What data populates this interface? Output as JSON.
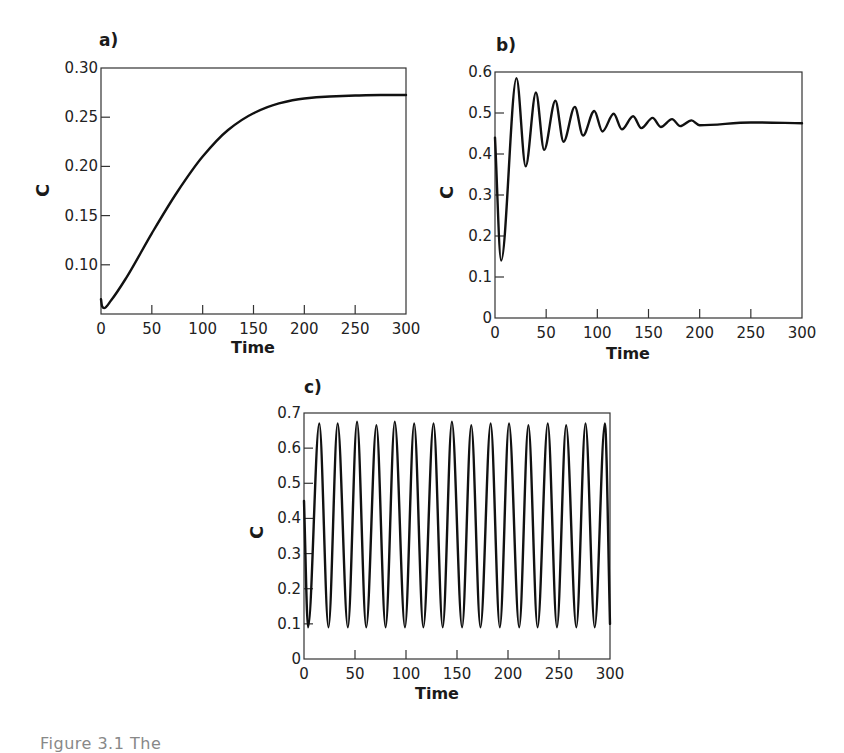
{
  "figure": {
    "caption_partial": "Figure 3.1  The"
  },
  "chart_data": [
    {
      "id": "a",
      "type": "line",
      "panel_label": "a)",
      "title": "",
      "xlabel": "Time",
      "ylabel": "C",
      "xlim": [
        0,
        300
      ],
      "ylim": [
        0.05,
        0.3
      ],
      "xticks": [
        0,
        50,
        100,
        150,
        200,
        250,
        300
      ],
      "xtick_labels": [
        "0",
        "50",
        "100",
        "150",
        "200",
        "250",
        "300"
      ],
      "yticks": [
        0.1,
        0.15,
        0.2,
        0.25,
        0.3
      ],
      "ytick_labels": [
        "0.10",
        "0.15",
        "0.20",
        "0.25",
        "0.30"
      ],
      "grid": false,
      "legend": null,
      "series": [
        {
          "name": "C",
          "color": "#111111",
          "x": [
            0,
            1,
            3,
            10,
            25,
            50,
            75,
            100,
            125,
            150,
            175,
            200,
            225,
            250,
            275,
            300
          ],
          "y": [
            0.065,
            0.058,
            0.056,
            0.064,
            0.087,
            0.132,
            0.174,
            0.21,
            0.237,
            0.254,
            0.264,
            0.269,
            0.271,
            0.272,
            0.2725,
            0.2725
          ]
        }
      ],
      "box": {
        "left": 101,
        "top": 68,
        "width": 305,
        "height": 246
      }
    },
    {
      "id": "b",
      "type": "line",
      "panel_label": "b)",
      "title": "",
      "xlabel": "Time",
      "ylabel": "C",
      "xlim": [
        0,
        300
      ],
      "ylim": [
        0,
        0.6
      ],
      "xticks": [
        0,
        50,
        100,
        150,
        200,
        250,
        300
      ],
      "xtick_labels": [
        "0",
        "50",
        "100",
        "150",
        "200",
        "250",
        "300"
      ],
      "yticks": [
        0,
        0.1,
        0.2,
        0.3,
        0.4,
        0.5,
        0.6
      ],
      "ytick_labels": [
        "0",
        "0.1",
        "0.2",
        "0.3",
        "0.4",
        "0.5",
        "0.6"
      ],
      "grid": false,
      "legend": null,
      "description": "Damped oscillation settling to steady state",
      "steady_state": 0.475,
      "period": 19,
      "series": [
        {
          "name": "C",
          "color": "#111111",
          "x": [
            0,
            6,
            21,
            30,
            40,
            48,
            59,
            67,
            78,
            86,
            97,
            105,
            116,
            124,
            135,
            143,
            154,
            162,
            173,
            181,
            192,
            200,
            250,
            300
          ],
          "y": [
            0.44,
            0.14,
            0.585,
            0.37,
            0.55,
            0.41,
            0.53,
            0.43,
            0.515,
            0.445,
            0.505,
            0.455,
            0.498,
            0.46,
            0.492,
            0.463,
            0.488,
            0.466,
            0.485,
            0.468,
            0.482,
            0.47,
            0.477,
            0.475
          ]
        }
      ],
      "box": {
        "left": 495,
        "top": 72,
        "width": 307,
        "height": 246
      }
    },
    {
      "id": "c",
      "type": "line",
      "panel_label": "c)",
      "title": "",
      "xlabel": "Time",
      "ylabel": "C",
      "xlim": [
        0,
        300
      ],
      "ylim": [
        0,
        0.7
      ],
      "xticks": [
        0,
        50,
        100,
        150,
        200,
        250,
        300
      ],
      "xtick_labels": [
        "0",
        "50",
        "100",
        "150",
        "200",
        "250",
        "300"
      ],
      "yticks": [
        0,
        0.1,
        0.2,
        0.3,
        0.4,
        0.5,
        0.6,
        0.7
      ],
      "ytick_labels": [
        "0",
        "0.1",
        "0.2",
        "0.3",
        "0.4",
        "0.5",
        "0.6",
        "0.7"
      ],
      "grid": false,
      "legend": null,
      "description": "Sustained oscillations (limit cycle)",
      "initial_value": 0.45,
      "first_trough_t": 4,
      "first_peak_t": 15,
      "period": 18.67,
      "peak_value": 0.67,
      "trough_value": 0.09,
      "peak_count": 16,
      "series": [
        {
          "name": "C",
          "color": "#111111",
          "x": [
            0,
            4,
            15,
            24,
            33,
            43,
            52,
            61,
            71,
            80,
            89,
            99,
            108,
            117,
            127,
            136,
            145,
            155,
            164,
            173,
            183,
            192,
            201,
            211,
            220,
            229,
            239,
            248,
            257,
            267,
            276,
            285,
            295,
            300
          ],
          "y": [
            0.45,
            0.09,
            0.67,
            0.09,
            0.67,
            0.09,
            0.675,
            0.09,
            0.665,
            0.09,
            0.675,
            0.09,
            0.67,
            0.09,
            0.67,
            0.09,
            0.675,
            0.09,
            0.665,
            0.09,
            0.67,
            0.09,
            0.67,
            0.09,
            0.665,
            0.09,
            0.67,
            0.09,
            0.665,
            0.09,
            0.67,
            0.09,
            0.67,
            0.1
          ]
        }
      ],
      "box": {
        "left": 304,
        "top": 413,
        "width": 306,
        "height": 246
      }
    }
  ]
}
